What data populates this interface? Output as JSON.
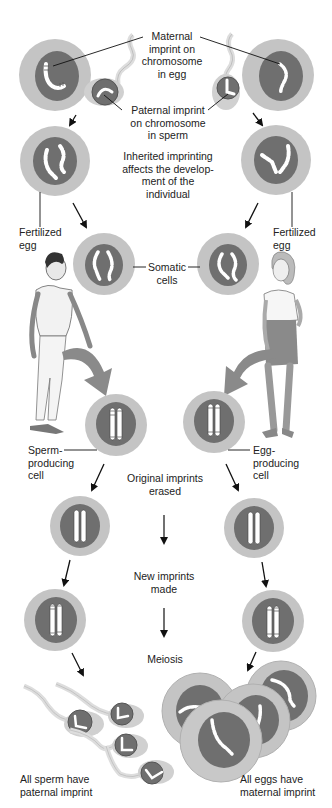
{
  "colors": {
    "cytoplasm": "#c4c4c4",
    "nucleus": "#6f6f6f",
    "nucleus_outline": "#5a5a5a",
    "chromosome": "#ffffff",
    "arrow": "#111111",
    "body_arrow": "#8a8a8a",
    "text": "#222222"
  },
  "labels": {
    "maternal_imprint": [
      "Maternal",
      "imprint on",
      "chromosome",
      "in egg"
    ],
    "paternal_imprint": [
      "Paternal imprint",
      "on chromosome",
      "in sperm"
    ],
    "inherited": [
      "Inherited imprinting",
      "affects the develop-",
      "ment of the",
      "individual"
    ],
    "fertilized_left": [
      "Fertilized",
      "egg"
    ],
    "fertilized_right": [
      "Fertilized",
      "egg"
    ],
    "somatic": [
      "Somatic",
      "cells"
    ],
    "sperm_producing": [
      "Sperm-",
      "producing",
      "cell"
    ],
    "egg_producing": [
      "Egg-",
      "producing",
      "cell"
    ],
    "erased": [
      "Original imprints",
      "erased"
    ],
    "new_imprints": [
      "New imprints",
      "made"
    ],
    "meiosis": [
      "Meiosis"
    ],
    "all_sperm": [
      "All sperm have",
      "paternal imprint"
    ],
    "all_eggs": [
      "All eggs have",
      "maternal imprint"
    ]
  },
  "figures": {
    "male": "man-figure",
    "female": "woman-figure"
  }
}
